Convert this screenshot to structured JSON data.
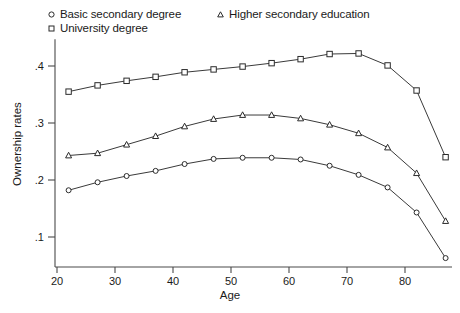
{
  "chart_data": {
    "type": "line",
    "title": "",
    "xlabel": "Age",
    "ylabel": "Ownership rates",
    "xlim": [
      18,
      90
    ],
    "ylim": [
      0.04,
      0.45
    ],
    "xticks": [
      20,
      30,
      40,
      50,
      60,
      70,
      80
    ],
    "xtick_labels": [
      "20",
      "30",
      "40",
      "50",
      "60",
      "70",
      "80"
    ],
    "yticks": [
      0.1,
      0.2,
      0.3,
      0.4
    ],
    "ytick_labels": [
      ".1",
      ".2",
      ".3",
      ".4"
    ],
    "grid": false,
    "legend_position": "top",
    "x": [
      22,
      27,
      32,
      37,
      42,
      47,
      52,
      57,
      62,
      67,
      72,
      77,
      82,
      87
    ],
    "series": [
      {
        "name": "Basic secondary degree",
        "marker": "circle",
        "values": [
          0.182,
          0.196,
          0.207,
          0.216,
          0.228,
          0.237,
          0.239,
          0.239,
          0.236,
          0.225,
          0.209,
          0.187,
          0.143,
          0.063
        ]
      },
      {
        "name": "University degree",
        "marker": "square",
        "values": [
          0.355,
          0.366,
          0.374,
          0.381,
          0.389,
          0.394,
          0.399,
          0.405,
          0.412,
          0.421,
          0.422,
          0.401,
          0.357,
          0.24
        ]
      },
      {
        "name": "Higher secondary education",
        "marker": "triangle",
        "values": [
          0.243,
          0.247,
          0.262,
          0.277,
          0.294,
          0.307,
          0.314,
          0.314,
          0.308,
          0.297,
          0.282,
          0.257,
          0.212,
          0.128
        ]
      }
    ],
    "colors": {
      "line": "#3a3a3a",
      "marker_fill": "#ffffff",
      "marker_stroke": "#2b2b2b",
      "axis": "#4a4a4a",
      "background": "#ffffff"
    }
  },
  "legend": {
    "entries": [
      {
        "label": "Basic secondary degree",
        "marker": "circle-marker"
      },
      {
        "label": "University degree",
        "marker": "square-marker"
      },
      {
        "label": "Higher secondary education",
        "marker": "triangle-marker"
      }
    ]
  },
  "axes": {
    "x_title": "Age",
    "y_title": "Ownership rates"
  }
}
